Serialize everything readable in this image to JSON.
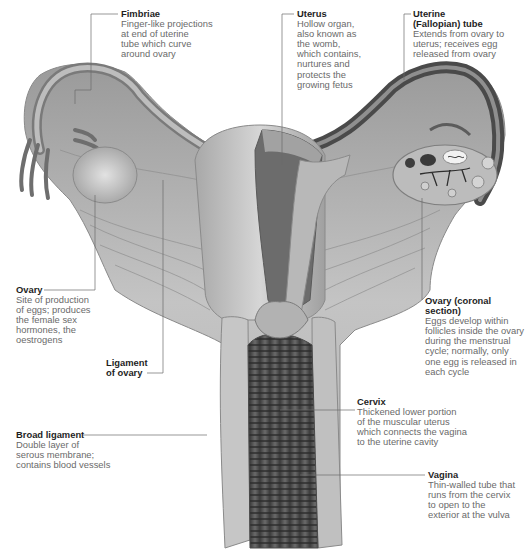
{
  "diagram": {
    "labels": [
      {
        "id": "fimbriae",
        "title": "Fimbriae",
        "description": "Finger-like projections\nat end of uterine\ntube which curve\naround ovary"
      },
      {
        "id": "uterus",
        "title": "Uterus",
        "description": "Hollow organ,\nalso known as\nthe womb,\nwhich contains,\nnurtures and\nprotects the\ngrowing fetus"
      },
      {
        "id": "uterine-tube",
        "title": "Uterine\n(Fallopian) tube",
        "description": "Extends from ovary to\nuterus; receives egg\nreleased from ovary"
      },
      {
        "id": "ovary",
        "title": "Ovary",
        "description": "Site of production\nof eggs; produces\nthe female sex\nhormones, the\noestrogens"
      },
      {
        "id": "ovary-coronal",
        "title": "Ovary (coronal\nsection)",
        "description": "Eggs develop within\nfollicles inside the ovary\nduring the menstrual\ncycle; normally, only\none egg is released in\neach cycle"
      },
      {
        "id": "ligament-of-ovary",
        "title": "Ligament\nof ovary",
        "description": ""
      },
      {
        "id": "cervix",
        "title": "Cervix",
        "description": "Thickened lower portion\nof the muscular uterus\nwhich connects the vagina\nto the uterine cavity"
      },
      {
        "id": "broad-ligament",
        "title": "Broad ligament",
        "description": "Double layer of\nserous membrane;\ncontains blood vessels"
      },
      {
        "id": "vagina",
        "title": "Vagina",
        "description": "Thin-walled tube that\nruns from the cervix\nto open to the\nexterior at the vulva"
      }
    ]
  }
}
